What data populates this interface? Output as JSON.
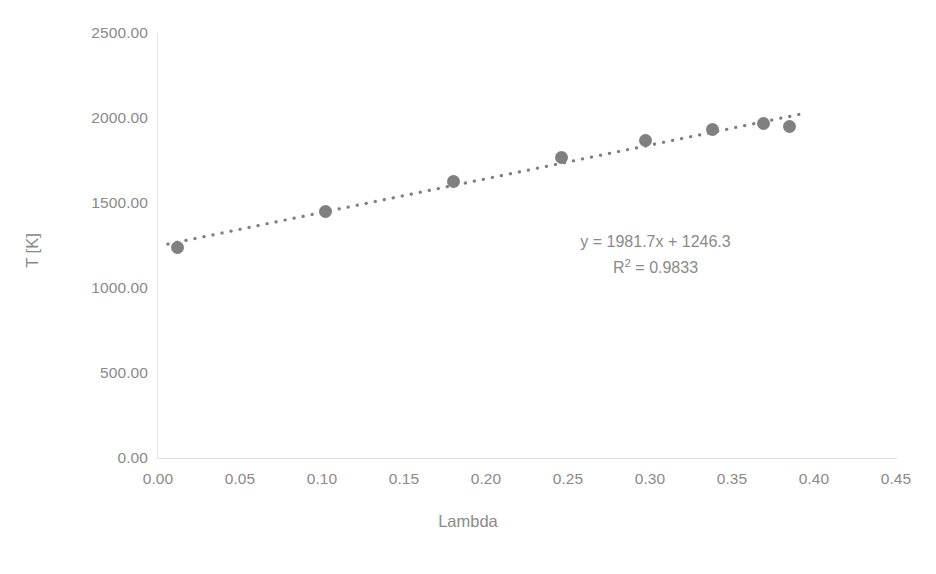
{
  "chart_data": {
    "type": "scatter",
    "title": "",
    "xlabel": "Lambda",
    "ylabel": "T [K]",
    "xlim": [
      0.0,
      0.45
    ],
    "ylim": [
      0.0,
      2500.0
    ],
    "grid": false,
    "legend": "none",
    "marker_color": "#808080",
    "trendline_color": "#808080",
    "trendline_style": "dotted",
    "x": [
      0.012,
      0.102,
      0.18,
      0.246,
      0.297,
      0.338,
      0.369,
      0.385
    ],
    "y": [
      1240.0,
      1452.0,
      1625.0,
      1765.0,
      1868.0,
      1930.0,
      1965.0,
      1950.0
    ],
    "points": [
      {
        "x": 0.012,
        "y": 1240.0
      },
      {
        "x": 0.102,
        "y": 1452.0
      },
      {
        "x": 0.18,
        "y": 1625.0
      },
      {
        "x": 0.246,
        "y": 1765.0
      },
      {
        "x": 0.297,
        "y": 1868.0
      },
      {
        "x": 0.338,
        "y": 1930.0
      },
      {
        "x": 0.369,
        "y": 1965.0
      },
      {
        "x": 0.385,
        "y": 1950.0
      }
    ],
    "xticks": [
      "0.00",
      "0.05",
      "0.10",
      "0.15",
      "0.20",
      "0.25",
      "0.30",
      "0.35",
      "0.40",
      "0.45"
    ],
    "xtick_values": [
      0.0,
      0.05,
      0.1,
      0.15,
      0.2,
      0.25,
      0.3,
      0.35,
      0.4,
      0.45
    ],
    "yticks": [
      "0.00",
      "500.00",
      "1000.00",
      "1500.00",
      "2000.00",
      "2500.00"
    ],
    "ytick_values": [
      0,
      500,
      1000,
      1500,
      2000,
      2500
    ],
    "annotations": {
      "equation": "y = 1981.7x + 1246.3",
      "r_squared_prefix": "R",
      "r_squared_exponent": "2",
      "r_squared_value": " = 0.9833",
      "r_squared_full": "R² = 0.9833"
    },
    "trendline": {
      "slope": 1981.7,
      "intercept": 1246.3,
      "r_squared": 0.9833,
      "x_start": 0.006,
      "x_end": 0.392
    }
  },
  "colors": {
    "axis": "#e2e2e2",
    "tick_text": "#8a8a8a",
    "marker": "#808080",
    "background": "#ffffff"
  }
}
